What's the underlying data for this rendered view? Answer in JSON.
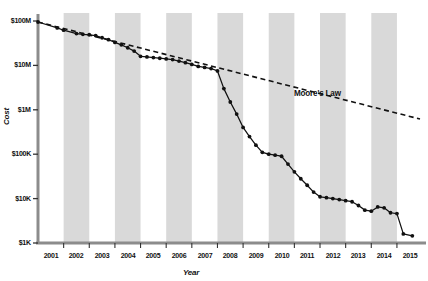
{
  "chart_data": {
    "type": "line",
    "title": "",
    "xlabel": "Year",
    "ylabel": "Cost",
    "yscale": "log",
    "ylim": [
      1000,
      100000000
    ],
    "xlim": [
      2001,
      2015.9
    ],
    "grid": false,
    "legend": null,
    "ytick_labels": [
      "$100M",
      "$10M",
      "$1M",
      "$100K",
      "$10K",
      "$1K"
    ],
    "ytick_values": [
      100000000,
      10000000,
      1000000,
      100000,
      10000,
      1000
    ],
    "xtick_labels": [
      "2001",
      "2002",
      "2003",
      "2004",
      "2005",
      "2006",
      "2007",
      "2008",
      "2009",
      "2010",
      "2011",
      "2012",
      "2013",
      "2014",
      "2015"
    ],
    "xtick_values": [
      2001,
      2002,
      2003,
      2004,
      2005,
      2006,
      2007,
      2008,
      2009,
      2010,
      2011,
      2012,
      2013,
      2014,
      2015
    ],
    "banded_years": [
      2002,
      2004,
      2006,
      2008,
      2010,
      2012,
      2014
    ],
    "band_color": "#d9d9d9",
    "series": [
      {
        "name": "Cost per Genome",
        "style": "solid-with-markers",
        "color": "#111111",
        "points": [
          {
            "x": 2001.0,
            "y": 95000000
          },
          {
            "x": 2001.75,
            "y": 70000000
          },
          {
            "x": 2002.0,
            "y": 62000000
          },
          {
            "x": 2002.5,
            "y": 52000000
          },
          {
            "x": 2002.75,
            "y": 50000000
          },
          {
            "x": 2003.0,
            "y": 49000000
          },
          {
            "x": 2003.25,
            "y": 47000000
          },
          {
            "x": 2003.5,
            "y": 42000000
          },
          {
            "x": 2003.75,
            "y": 38000000
          },
          {
            "x": 2004.0,
            "y": 33000000
          },
          {
            "x": 2004.25,
            "y": 29000000
          },
          {
            "x": 2004.5,
            "y": 25000000
          },
          {
            "x": 2004.75,
            "y": 21000000
          },
          {
            "x": 2005.0,
            "y": 16000000
          },
          {
            "x": 2005.25,
            "y": 15500000
          },
          {
            "x": 2005.5,
            "y": 15000000
          },
          {
            "x": 2005.75,
            "y": 14500000
          },
          {
            "x": 2006.0,
            "y": 14000000
          },
          {
            "x": 2006.25,
            "y": 13500000
          },
          {
            "x": 2006.5,
            "y": 12500000
          },
          {
            "x": 2006.75,
            "y": 11500000
          },
          {
            "x": 2007.0,
            "y": 10500000
          },
          {
            "x": 2007.25,
            "y": 9500000
          },
          {
            "x": 2007.5,
            "y": 9000000
          },
          {
            "x": 2007.75,
            "y": 8500000
          },
          {
            "x": 2008.0,
            "y": 7500000
          },
          {
            "x": 2008.25,
            "y": 3000000
          },
          {
            "x": 2008.5,
            "y": 1500000
          },
          {
            "x": 2008.75,
            "y": 800000
          },
          {
            "x": 2009.0,
            "y": 400000
          },
          {
            "x": 2009.25,
            "y": 250000
          },
          {
            "x": 2009.5,
            "y": 160000
          },
          {
            "x": 2009.75,
            "y": 110000
          },
          {
            "x": 2010.0,
            "y": 100000
          },
          {
            "x": 2010.25,
            "y": 95000
          },
          {
            "x": 2010.5,
            "y": 90000
          },
          {
            "x": 2010.75,
            "y": 60000
          },
          {
            "x": 2011.0,
            "y": 40000
          },
          {
            "x": 2011.25,
            "y": 28000
          },
          {
            "x": 2011.5,
            "y": 20000
          },
          {
            "x": 2011.75,
            "y": 14000
          },
          {
            "x": 2012.0,
            "y": 11000
          },
          {
            "x": 2012.25,
            "y": 10500
          },
          {
            "x": 2012.5,
            "y": 10000
          },
          {
            "x": 2012.75,
            "y": 9500
          },
          {
            "x": 2013.0,
            "y": 9000
          },
          {
            "x": 2013.25,
            "y": 8500
          },
          {
            "x": 2013.5,
            "y": 7000
          },
          {
            "x": 2013.75,
            "y": 5500
          },
          {
            "x": 2014.0,
            "y": 5200
          },
          {
            "x": 2014.25,
            "y": 6500
          },
          {
            "x": 2014.5,
            "y": 6200
          },
          {
            "x": 2014.75,
            "y": 4800
          },
          {
            "x": 2015.0,
            "y": 4600
          },
          {
            "x": 2015.25,
            "y": 1600
          },
          {
            "x": 2015.6,
            "y": 1450
          }
        ]
      },
      {
        "name": "Moore's Law",
        "style": "dashed",
        "color": "#111111",
        "label": "Moore's Law",
        "points": [
          {
            "x": 2001.0,
            "y": 95000000
          },
          {
            "x": 2015.9,
            "y": 620000
          }
        ]
      }
    ],
    "annotations": [
      {
        "text": "Moore's Law",
        "x": 2011.0,
        "y": 2300000
      }
    ]
  }
}
